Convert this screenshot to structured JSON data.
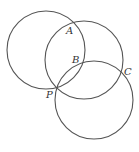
{
  "diagram": {
    "circles": [
      {
        "id": "circle-1",
        "cx": 46,
        "cy": 50,
        "r": 39
      },
      {
        "id": "circle-2",
        "cx": 84,
        "cy": 60,
        "r": 39
      },
      {
        "id": "circle-3",
        "cx": 94,
        "cy": 100,
        "r": 39
      }
    ],
    "labels": [
      {
        "id": "A",
        "text": "A",
        "x": 67,
        "y": 26
      },
      {
        "id": "B",
        "text": "B",
        "x": 73,
        "y": 56
      },
      {
        "id": "C",
        "text": "C",
        "x": 125,
        "y": 68
      },
      {
        "id": "P",
        "text": "P",
        "x": 47,
        "y": 90
      }
    ],
    "stroke_color": "#555555"
  }
}
